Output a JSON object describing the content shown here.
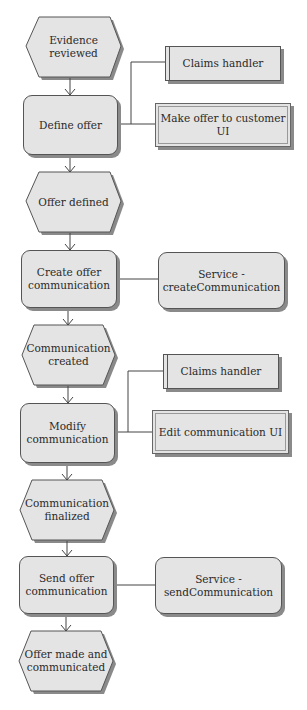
{
  "diagram": {
    "type": "EPC process flow",
    "colors": {
      "fill": "#e4e4e4",
      "stroke": "#555555",
      "shadow": "#8a8a8a",
      "line": "#444444"
    },
    "flow": [
      {
        "kind": "event",
        "label": "Evidence reviewed"
      },
      {
        "kind": "function",
        "label": "Define offer"
      },
      {
        "kind": "event",
        "label": "Offer defined"
      },
      {
        "kind": "function",
        "label": "Create offer communication"
      },
      {
        "kind": "event",
        "label": "Communication created"
      },
      {
        "kind": "function",
        "label": "Modify communication"
      },
      {
        "kind": "event",
        "label": "Communication finalized"
      },
      {
        "kind": "function",
        "label": "Send offer communication"
      },
      {
        "kind": "event",
        "label": "Offer made and communicated"
      }
    ],
    "attachments": [
      {
        "kind": "role",
        "label": "Claims handler",
        "to": "Define offer"
      },
      {
        "kind": "system",
        "label": "Make offer to customer UI",
        "to": "Define offer"
      },
      {
        "kind": "service",
        "label": "Service - createCommunication",
        "to": "Create offer communication"
      },
      {
        "kind": "role",
        "label": "Claims handler",
        "to": "Modify communication"
      },
      {
        "kind": "system",
        "label": "Edit communication UI",
        "to": "Modify communication"
      },
      {
        "kind": "service",
        "label": "Service - sendCommunication",
        "to": "Send offer communication"
      }
    ]
  },
  "labels": {
    "e1a": "Evidence",
    "e1b": "reviewed",
    "f1": "Define offer",
    "r1": "Claims handler",
    "s1": "Make offer to customer UI",
    "e2": "Offer defined",
    "f2a": "Create offer",
    "f2b": "communication",
    "v1a": "Service -",
    "v1b": "createCommunication",
    "e3a": "Communication",
    "e3b": "created",
    "f3a": "Modify",
    "f3b": "communication",
    "r2": "Claims handler",
    "s2": "Edit communication UI",
    "e4a": "Communication",
    "e4b": "finalized",
    "f4a": "Send offer",
    "f4b": "communication",
    "v2a": "Service -",
    "v2b": "sendCommunication",
    "e5a": "Offer made and",
    "e5b": "communicated"
  }
}
